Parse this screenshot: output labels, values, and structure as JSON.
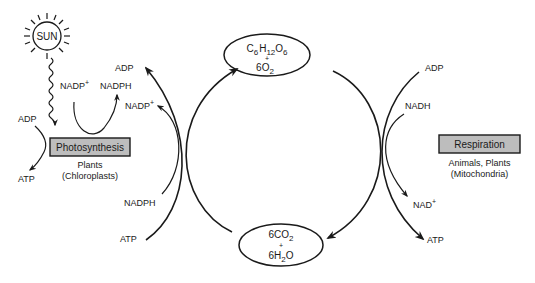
{
  "diagram": {
    "type": "cycle",
    "sun": {
      "label": "SUN"
    },
    "photosynthesis": {
      "box_label": "Photosynthesis",
      "subtitle_line1": "Plants",
      "subtitle_line2": "(Chloroplasts)",
      "inputs_left": {
        "in": "ADP",
        "out": "ATP"
      },
      "top_loop": {
        "in": "NADP",
        "in_sup": "+",
        "out": "NADPH"
      }
    },
    "respiration": {
      "box_label": "Respiration",
      "subtitle_line1": "Animals, Plants",
      "subtitle_line2": "(Mitochondria)"
    },
    "top_product": {
      "line1": {
        "C": "C",
        "c_sub": "6",
        "H": "H",
        "h_sub": "12",
        "O": "O",
        "o_sub": "6"
      },
      "plus": "+",
      "line2": {
        "coef": "6O",
        "sub": "2"
      }
    },
    "bottom_product": {
      "line1": {
        "coef": "6CO",
        "sub": "2"
      },
      "plus": "+",
      "line2": {
        "pre": "6H",
        "sub": "2",
        "post": "O"
      }
    },
    "left_arc_labels": {
      "adp": "ADP",
      "nadp": "NADP",
      "nadp_sup": "+",
      "nadph": "NADPH",
      "atp": "ATP"
    },
    "right_arc_labels": {
      "adp": "ADP",
      "nadh": "NADH",
      "nad": "NAD",
      "nad_sup": "+",
      "atp": "ATP"
    },
    "colors": {
      "box_fill": "#bdbdbd",
      "stroke": "#1a1a1a",
      "background": "#ffffff"
    }
  }
}
